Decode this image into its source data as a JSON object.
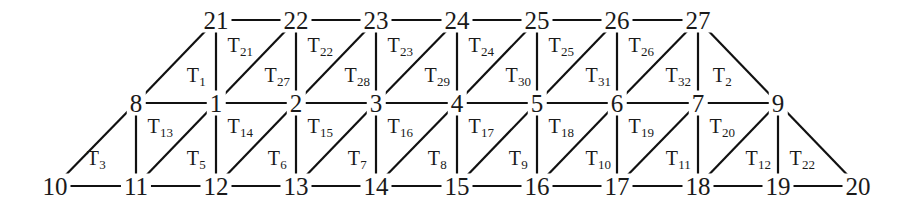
{
  "figure": {
    "type": "triangulated-mesh-graph",
    "colors": {
      "line": "#111111",
      "text": "#1a1a1a",
      "background": "#ffffff"
    }
  },
  "rows": {
    "top": {
      "y": 20,
      "nodes": [
        {
          "label": "21",
          "x": 216
        },
        {
          "label": "22",
          "x": 296
        },
        {
          "label": "23",
          "x": 376
        },
        {
          "label": "24",
          "x": 457
        },
        {
          "label": "25",
          "x": 537
        },
        {
          "label": "26",
          "x": 617
        },
        {
          "label": "27",
          "x": 698
        }
      ]
    },
    "middle": {
      "y": 103,
      "nodes": [
        {
          "label": "8",
          "x": 136
        },
        {
          "label": "1",
          "x": 216
        },
        {
          "label": "2",
          "x": 296
        },
        {
          "label": "3",
          "x": 376
        },
        {
          "label": "4",
          "x": 457
        },
        {
          "label": "5",
          "x": 537
        },
        {
          "label": "6",
          "x": 617
        },
        {
          "label": "7",
          "x": 698
        },
        {
          "label": "9",
          "x": 778
        }
      ]
    },
    "bottom": {
      "y": 186,
      "nodes": [
        {
          "label": "10",
          "x": 55
        },
        {
          "label": "11",
          "x": 136
        },
        {
          "label": "12",
          "x": 216
        },
        {
          "label": "13",
          "x": 296
        },
        {
          "label": "14",
          "x": 376
        },
        {
          "label": "15",
          "x": 457
        },
        {
          "label": "16",
          "x": 537
        },
        {
          "label": "17",
          "x": 617
        },
        {
          "label": "18",
          "x": 698
        },
        {
          "label": "19",
          "x": 778
        },
        {
          "label": "20",
          "x": 858
        }
      ]
    }
  },
  "face_labels": {
    "upper_band": [
      {
        "base": "T",
        "sub": "1",
        "x": 196,
        "y": 75
      },
      {
        "base": "T",
        "sub": "21",
        "x": 240,
        "y": 45
      },
      {
        "base": "T",
        "sub": "27",
        "x": 277,
        "y": 75
      },
      {
        "base": "T",
        "sub": "22",
        "x": 320,
        "y": 45
      },
      {
        "base": "T",
        "sub": "28",
        "x": 357,
        "y": 75
      },
      {
        "base": "T",
        "sub": "23",
        "x": 400,
        "y": 45
      },
      {
        "base": "T",
        "sub": "29",
        "x": 437,
        "y": 75
      },
      {
        "base": "T",
        "sub": "24",
        "x": 481,
        "y": 45
      },
      {
        "base": "T",
        "sub": "30",
        "x": 518,
        "y": 75
      },
      {
        "base": "T",
        "sub": "25",
        "x": 561,
        "y": 45
      },
      {
        "base": "T",
        "sub": "31",
        "x": 598,
        "y": 75
      },
      {
        "base": "T",
        "sub": "26",
        "x": 641,
        "y": 45
      },
      {
        "base": "T",
        "sub": "32",
        "x": 678,
        "y": 75
      },
      {
        "base": "T",
        "sub": "2",
        "x": 722,
        "y": 75
      }
    ],
    "lower_band": [
      {
        "base": "T",
        "sub": "3",
        "x": 96,
        "y": 158
      },
      {
        "base": "T",
        "sub": "13",
        "x": 160,
        "y": 126
      },
      {
        "base": "T",
        "sub": "5",
        "x": 196,
        "y": 158
      },
      {
        "base": "T",
        "sub": "14",
        "x": 240,
        "y": 126
      },
      {
        "base": "T",
        "sub": "6",
        "x": 277,
        "y": 158
      },
      {
        "base": "T",
        "sub": "15",
        "x": 320,
        "y": 126
      },
      {
        "base": "T",
        "sub": "7",
        "x": 357,
        "y": 158
      },
      {
        "base": "T",
        "sub": "16",
        "x": 400,
        "y": 126
      },
      {
        "base": "T",
        "sub": "8",
        "x": 437,
        "y": 158
      },
      {
        "base": "T",
        "sub": "17",
        "x": 481,
        "y": 126
      },
      {
        "base": "T",
        "sub": "9",
        "x": 518,
        "y": 158
      },
      {
        "base": "T",
        "sub": "18",
        "x": 561,
        "y": 126
      },
      {
        "base": "T",
        "sub": "10",
        "x": 598,
        "y": 158
      },
      {
        "base": "T",
        "sub": "19",
        "x": 641,
        "y": 126
      },
      {
        "base": "T",
        "sub": "11",
        "x": 678,
        "y": 158
      },
      {
        "base": "T",
        "sub": "20",
        "x": 722,
        "y": 126
      },
      {
        "base": "T",
        "sub": "12",
        "x": 758,
        "y": 158
      },
      {
        "base": "T",
        "sub": "22",
        "x": 802,
        "y": 158
      }
    ]
  },
  "edges": {
    "top_horizontal": [
      [
        216,
        20,
        296,
        20
      ],
      [
        296,
        20,
        376,
        20
      ],
      [
        376,
        20,
        457,
        20
      ],
      [
        457,
        20,
        537,
        20
      ],
      [
        537,
        20,
        617,
        20
      ],
      [
        617,
        20,
        698,
        20
      ]
    ],
    "middle_horizontal": [
      [
        136,
        103,
        216,
        103
      ],
      [
        216,
        103,
        296,
        103
      ],
      [
        296,
        103,
        376,
        103
      ],
      [
        376,
        103,
        457,
        103
      ],
      [
        457,
        103,
        537,
        103
      ],
      [
        537,
        103,
        617,
        103
      ],
      [
        617,
        103,
        698,
        103
      ],
      [
        698,
        103,
        778,
        103
      ]
    ],
    "bottom_horizontal": [
      [
        55,
        186,
        136,
        186
      ],
      [
        136,
        186,
        216,
        186
      ],
      [
        216,
        186,
        296,
        186
      ],
      [
        296,
        186,
        376,
        186
      ],
      [
        376,
        186,
        457,
        186
      ],
      [
        457,
        186,
        537,
        186
      ],
      [
        537,
        186,
        617,
        186
      ],
      [
        617,
        186,
        698,
        186
      ],
      [
        698,
        186,
        778,
        186
      ],
      [
        778,
        186,
        858,
        186
      ]
    ],
    "vertical_upper": [
      [
        216,
        20,
        216,
        103
      ],
      [
        296,
        20,
        296,
        103
      ],
      [
        376,
        20,
        376,
        103
      ],
      [
        457,
        20,
        457,
        103
      ],
      [
        537,
        20,
        537,
        103
      ],
      [
        617,
        20,
        617,
        103
      ],
      [
        698,
        20,
        698,
        103
      ]
    ],
    "vertical_lower": [
      [
        136,
        103,
        136,
        186
      ],
      [
        216,
        103,
        216,
        186
      ],
      [
        296,
        103,
        296,
        186
      ],
      [
        376,
        103,
        376,
        186
      ],
      [
        457,
        103,
        457,
        186
      ],
      [
        537,
        103,
        537,
        186
      ],
      [
        617,
        103,
        617,
        186
      ],
      [
        698,
        103,
        698,
        186
      ],
      [
        778,
        103,
        778,
        186
      ]
    ],
    "diagonal_upper": [
      [
        136,
        103,
        216,
        20
      ],
      [
        216,
        103,
        296,
        20
      ],
      [
        296,
        103,
        376,
        20
      ],
      [
        376,
        103,
        457,
        20
      ],
      [
        457,
        103,
        537,
        20
      ],
      [
        537,
        103,
        617,
        20
      ],
      [
        617,
        103,
        698,
        20
      ]
    ],
    "diagonal_lower": [
      [
        55,
        186,
        136,
        103
      ],
      [
        136,
        186,
        216,
        103
      ],
      [
        216,
        186,
        296,
        103
      ],
      [
        296,
        186,
        376,
        103
      ],
      [
        376,
        186,
        457,
        103
      ],
      [
        457,
        186,
        537,
        103
      ],
      [
        537,
        186,
        617,
        103
      ],
      [
        617,
        186,
        698,
        103
      ],
      [
        698,
        186,
        778,
        103
      ]
    ],
    "right_slopes": [
      [
        698,
        20,
        778,
        103
      ],
      [
        778,
        103,
        858,
        186
      ]
    ]
  }
}
